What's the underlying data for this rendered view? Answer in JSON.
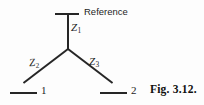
{
  "figure": {
    "caption": "Fig. 3.12.",
    "type": "star-network-three-impedance",
    "background_color": "#fdfdfd",
    "line_color": "#262626",
    "text_color": "#1d1d1d"
  },
  "reference": {
    "label": "Reference",
    "bar_name": "reference-bar"
  },
  "branches": [
    {
      "id": "z1",
      "symbol": "Z",
      "subscript": "1",
      "label": "Z1",
      "orientation": "vertical",
      "from": "center-node",
      "to": "reference"
    },
    {
      "id": "z2",
      "symbol": "Z",
      "subscript": "2",
      "label": "Z2",
      "orientation": "diagonal-left",
      "from": "center-node",
      "to": "terminal-1"
    },
    {
      "id": "z3",
      "symbol": "Z",
      "subscript": "3",
      "label": "Z3",
      "orientation": "diagonal-right",
      "from": "center-node",
      "to": "terminal-2"
    }
  ],
  "terminals": [
    {
      "id": "terminal-1",
      "label": "1"
    },
    {
      "id": "terminal-2",
      "label": "2"
    }
  ]
}
